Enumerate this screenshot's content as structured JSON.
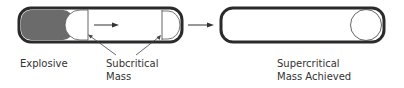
{
  "diagram": {
    "title": "",
    "stages": [
      {
        "id": "before",
        "components": [
          "explosive",
          "subcritical-mass",
          "subcritical-mass"
        ],
        "labels": {
          "explosive": "Explosive",
          "subcritical_line1": "Subcritical",
          "subcritical_line2": "Mass"
        }
      },
      {
        "id": "after",
        "labels": {
          "line1": "Supercritical",
          "line2": "Mass Achieved"
        }
      }
    ],
    "colors": {
      "outline": "#2b2b2b",
      "explosive_fill": "#6b6b6b",
      "thin_line": "#555555",
      "text": "#333333"
    }
  }
}
